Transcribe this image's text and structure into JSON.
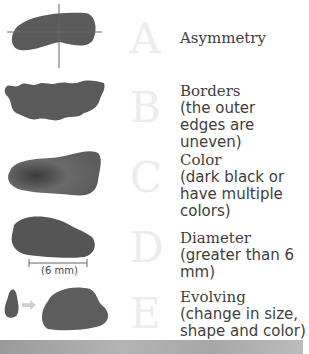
{
  "items": [
    {
      "letter": "A",
      "heading": "Asymmetry",
      "description": ""
    },
    {
      "letter": "B",
      "heading": "Borders",
      "description": "(the outer edges are uneven)"
    },
    {
      "letter": "C",
      "heading": "Color",
      "description": "(dark black or have multiple colors)"
    },
    {
      "letter": "D",
      "heading": "Diameter",
      "description": "(greater than 6 mm)",
      "measure_label": "(6 mm)"
    },
    {
      "letter": "E",
      "heading": "Evolving",
      "description": "(change in size, shape and color)"
    }
  ],
  "colors": {
    "lesion": "#5a5a5a",
    "letter": "#ececec",
    "text": "#3e3e3e"
  }
}
